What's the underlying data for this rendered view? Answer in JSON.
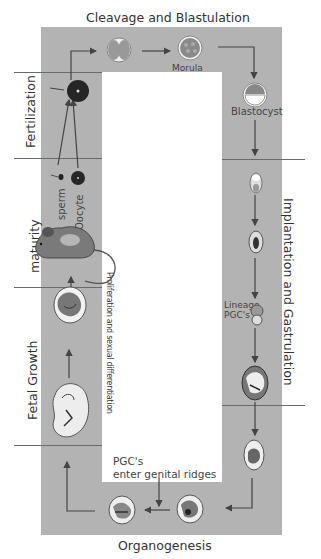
{
  "title": "Cleavage and Blastulation",
  "stages": {
    "top": "Cleavage and Blastulation",
    "right": "Implantation and Gastrulation",
    "bottom": "Organogenesis",
    "left_fertilization": "Fertilization",
    "left_maturity": "maturity",
    "left_fetal": "Fetal Growth"
  },
  "labels": {
    "morula": "Morula",
    "blastocyst": "Blastocyst",
    "sperm": "sperm",
    "oocyte": "Oocyte",
    "lineage": "Lineage",
    "pgcs": "PGC's",
    "pgc_enter_1": "PGC's",
    "pgc_enter_2": "enter genital ridges",
    "proliferation": "Proliferation and sexual differentiation"
  },
  "icons": {
    "two_cell": "two-cell-embryo",
    "morula": "morula-cell",
    "blastocyst": "blastocyst-cell",
    "zygote": "fertilized-egg",
    "sperm": "sperm-cell",
    "oocyte": "oocyte-cell",
    "mouse": "adult-mouse",
    "fetus": "fetus",
    "embryo": "embryo"
  },
  "colors": {
    "frame": "#b3b3b3",
    "line": "#444444",
    "text": "#333333"
  }
}
